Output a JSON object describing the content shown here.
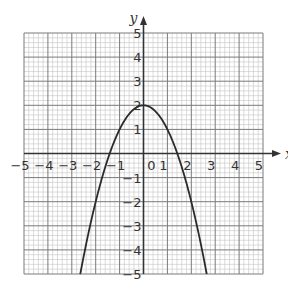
{
  "chart_data": {
    "type": "line",
    "title": "",
    "xlabel": "x",
    "ylabel": "y",
    "xlim": [
      -5,
      5
    ],
    "ylim": [
      -5,
      5
    ],
    "grid": true,
    "grid_minor_per_unit": 5,
    "x_ticks": [
      "-5",
      "-4",
      "-3",
      "-2",
      "-1",
      "0",
      "1",
      "2",
      "3",
      "4",
      "5"
    ],
    "y_ticks": [
      "-5",
      "-4",
      "-3",
      "-2",
      "-1",
      "1",
      "2",
      "3",
      "4",
      "5"
    ],
    "origin_label": "0",
    "series": [
      {
        "name": "y = 2 - x^2",
        "equation": "y = 2 - x^2",
        "x": [
          -2.65,
          -2.5,
          -2,
          -1.5,
          -1,
          -0.5,
          0,
          0.5,
          1,
          1.5,
          2,
          2.5,
          2.65
        ],
        "y": [
          -5.02,
          -4.25,
          -2,
          -0.25,
          1,
          1.75,
          2,
          1.75,
          1,
          -0.25,
          -2,
          -4.25,
          -5.02
        ]
      }
    ],
    "colors": {
      "curve": "#2a2a2a",
      "grid_major": "#7a7a7a",
      "grid_minor": "#c4c4c4",
      "axis": "#333333"
    }
  }
}
